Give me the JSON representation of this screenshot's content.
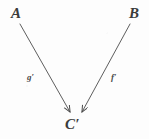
{
  "figure": {
    "kind": "commutative-diagram",
    "background_color": "#fdfdfd",
    "ink_color": "#4a4a4a",
    "width": 149,
    "height": 139
  },
  "objects": [
    {
      "id": "A",
      "label": "A",
      "x": 11,
      "y": 6,
      "role": "source-left"
    },
    {
      "id": "B",
      "label": "B",
      "x": 129,
      "y": 6,
      "role": "source-right"
    },
    {
      "id": "Cp",
      "label": "C′",
      "x": 65,
      "y": 117,
      "role": "target-bottom"
    }
  ],
  "arrows": [
    {
      "id": "g-prime",
      "from": "A",
      "to": "Cp",
      "label": "g′",
      "label_x": 27,
      "label_y": 73,
      "x1": 20,
      "y1": 24,
      "x2": 70,
      "y2": 112,
      "head": "open-arrowhead"
    },
    {
      "id": "f-prime",
      "from": "B",
      "to": "Cp",
      "label": "f′",
      "label_x": 111,
      "label_y": 73,
      "x1": 130,
      "y1": 24,
      "x2": 82,
      "y2": 112,
      "head": "open-arrowhead"
    }
  ]
}
